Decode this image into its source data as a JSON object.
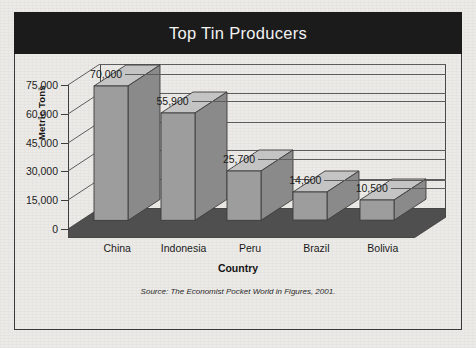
{
  "figure": {
    "title": "Top Tin Producers",
    "source_note": "Source: The Economist Pocket World in Figures, 2001."
  },
  "chart_data": {
    "type": "bar",
    "title": "Top Tin Producers",
    "xlabel": "Country",
    "ylabel": "Metric Tons",
    "categories": [
      "China",
      "Indonesia",
      "Peru",
      "Brazil",
      "Bolivia"
    ],
    "values": [
      70000,
      55900,
      25700,
      14600,
      10500
    ],
    "value_labels": [
      "70,000",
      "55,900",
      "25,700",
      "14,600",
      "10,500"
    ],
    "ylim": [
      0,
      75000
    ],
    "yticks": [
      0,
      15000,
      30000,
      45000,
      60000,
      75000
    ],
    "ytick_labels": [
      "0",
      "15,000",
      "30,000",
      "45,000",
      "60,000",
      "75,000"
    ],
    "grid": true,
    "legend": "none",
    "style": "3d-column",
    "colors": {
      "bar_front": "#9d9d9d",
      "bar_side": "#8a8a8a",
      "bar_top": "#c4c4c4",
      "floor": "#4f4f4f",
      "title_bar": "#1b1b1b",
      "title_text": "#f2f2f2",
      "background": "#eceae7",
      "axis": "#3d3d3d"
    }
  }
}
